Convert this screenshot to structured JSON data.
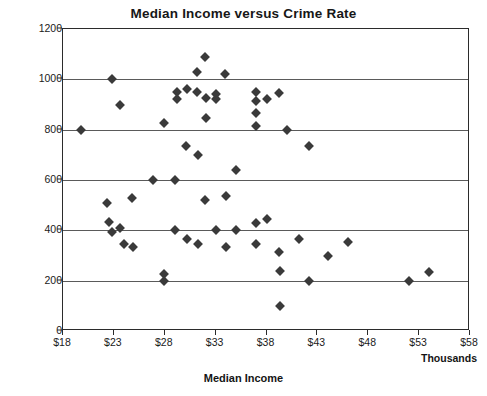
{
  "chart_data": {
    "type": "scatter",
    "title": "Median Income versus Crime Rate",
    "xlabel": "Median Income",
    "ylabel": "Crime Rate",
    "x_unit_note": "Thousands",
    "xlim": [
      18,
      58
    ],
    "ylim": [
      0,
      1200
    ],
    "xticks": [
      "$18",
      "$23",
      "$28",
      "$33",
      "$38",
      "$43",
      "$48",
      "$53",
      "$58"
    ],
    "xtick_values": [
      18,
      23,
      28,
      33,
      38,
      43,
      48,
      53,
      58
    ],
    "yticks": [
      "0",
      "200",
      "400",
      "600",
      "800",
      "1000",
      "1200"
    ],
    "ytick_values": [
      0,
      200,
      400,
      600,
      800,
      1000,
      1200
    ],
    "grid": "horizontal",
    "legend": "none",
    "marker": "diamond",
    "marker_color": "#3a3a3a",
    "points": [
      {
        "x": 19.8,
        "y": 800
      },
      {
        "x": 22.8,
        "y": 1000
      },
      {
        "x": 22.3,
        "y": 510
      },
      {
        "x": 22.5,
        "y": 435
      },
      {
        "x": 22.8,
        "y": 395
      },
      {
        "x": 23.6,
        "y": 900
      },
      {
        "x": 23.6,
        "y": 410
      },
      {
        "x": 24.0,
        "y": 345
      },
      {
        "x": 24.8,
        "y": 530
      },
      {
        "x": 24.9,
        "y": 335
      },
      {
        "x": 26.8,
        "y": 600
      },
      {
        "x": 27.9,
        "y": 825
      },
      {
        "x": 27.9,
        "y": 225
      },
      {
        "x": 27.9,
        "y": 200
      },
      {
        "x": 29.0,
        "y": 600
      },
      {
        "x": 29.0,
        "y": 400
      },
      {
        "x": 29.2,
        "y": 950
      },
      {
        "x": 29.2,
        "y": 920
      },
      {
        "x": 30.2,
        "y": 960
      },
      {
        "x": 30.1,
        "y": 735
      },
      {
        "x": 30.2,
        "y": 365
      },
      {
        "x": 31.2,
        "y": 950
      },
      {
        "x": 31.2,
        "y": 1030
      },
      {
        "x": 31.3,
        "y": 700
      },
      {
        "x": 31.3,
        "y": 345
      },
      {
        "x": 32.0,
        "y": 1090
      },
      {
        "x": 32.1,
        "y": 925
      },
      {
        "x": 32.1,
        "y": 845
      },
      {
        "x": 32.0,
        "y": 520
      },
      {
        "x": 33.0,
        "y": 940
      },
      {
        "x": 33.0,
        "y": 920
      },
      {
        "x": 33.0,
        "y": 400
      },
      {
        "x": 33.9,
        "y": 1020
      },
      {
        "x": 34.0,
        "y": 535
      },
      {
        "x": 34.0,
        "y": 335
      },
      {
        "x": 35.0,
        "y": 640
      },
      {
        "x": 35.0,
        "y": 400
      },
      {
        "x": 37.0,
        "y": 950
      },
      {
        "x": 37.0,
        "y": 915
      },
      {
        "x": 37.0,
        "y": 865
      },
      {
        "x": 37.0,
        "y": 815
      },
      {
        "x": 37.0,
        "y": 430
      },
      {
        "x": 37.0,
        "y": 345
      },
      {
        "x": 38.0,
        "y": 920
      },
      {
        "x": 38.0,
        "y": 445
      },
      {
        "x": 39.2,
        "y": 945
      },
      {
        "x": 39.2,
        "y": 315
      },
      {
        "x": 39.3,
        "y": 240
      },
      {
        "x": 39.3,
        "y": 100
      },
      {
        "x": 40.0,
        "y": 800
      },
      {
        "x": 41.2,
        "y": 365
      },
      {
        "x": 42.2,
        "y": 200
      },
      {
        "x": 42.2,
        "y": 735
      },
      {
        "x": 44.0,
        "y": 300
      },
      {
        "x": 46.0,
        "y": 355
      },
      {
        "x": 52.0,
        "y": 200
      },
      {
        "x": 54.0,
        "y": 235
      }
    ]
  }
}
